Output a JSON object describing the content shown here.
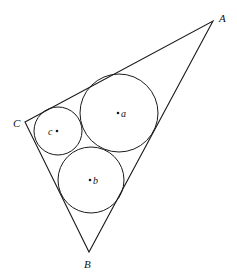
{
  "diagram": {
    "stroke_color": "#1a1a1a",
    "background": "#ffffff",
    "vertices": {
      "A": {
        "label": "A",
        "x": 213,
        "y": 21,
        "lx": 219,
        "ly": 22
      },
      "B": {
        "label": "B",
        "x": 89,
        "y": 252,
        "lx": 84,
        "ly": 268
      },
      "C": {
        "label": "C",
        "x": 25,
        "y": 122,
        "lx": 13,
        "ly": 127
      }
    },
    "circles": [
      {
        "id": "a",
        "label": "a",
        "cx": 119,
        "cy": 113,
        "r": 39,
        "lx": 122,
        "ly": 117
      },
      {
        "id": "b",
        "label": "b",
        "cx": 91,
        "cy": 180,
        "r": 33,
        "lx": 94,
        "ly": 184
      },
      {
        "id": "c",
        "label": "c",
        "cx": 58,
        "cy": 131,
        "r": 24,
        "lx": 48,
        "ly": 135
      }
    ]
  }
}
